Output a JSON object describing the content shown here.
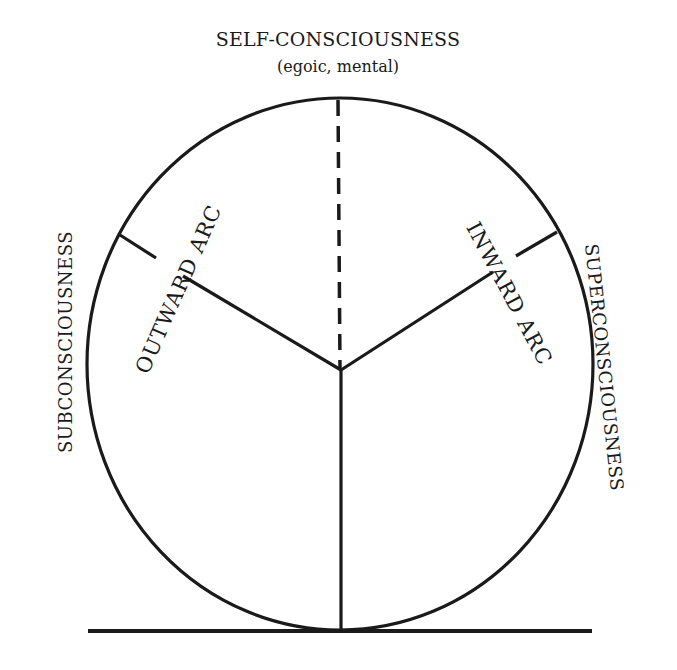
{
  "diagram": {
    "title": "SELF-CONSCIOUSNESS",
    "subtitle": "(egoic, mental)",
    "left_label": "SUBCONSCIOUSNESS",
    "right_label": "SUPERCONSCIOUSNESS",
    "outward_arc_label": "OUTWARD ARC",
    "inward_arc_label": "INWARD ARC",
    "colors": {
      "ink": "#1a1a1a",
      "background": "#ffffff"
    }
  }
}
